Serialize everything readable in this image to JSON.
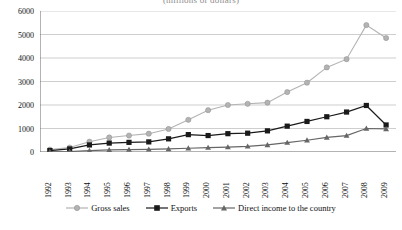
{
  "chart_data": {
    "type": "line",
    "title": "(millions of dollars)",
    "xlabel": "",
    "ylabel": "",
    "ylim": [
      0,
      6000
    ],
    "ytick_step": 1000,
    "yticks": [
      "0",
      "1000",
      "2000",
      "3000",
      "4000",
      "5000",
      "6000"
    ],
    "grid": true,
    "legend_position": "bottom",
    "categories": [
      "1992",
      "1993",
      "1994",
      "1995",
      "1996",
      "1997",
      "1998",
      "1999",
      "2000",
      "2001",
      "2002",
      "2003",
      "2004",
      "2005",
      "2006",
      "2007",
      "2008",
      "2009"
    ],
    "series": [
      {
        "name": "Gross sales",
        "color": "#b3b3b3",
        "marker": "circle",
        "values": [
          100,
          190,
          440,
          620,
          700,
          780,
          980,
          1370,
          1780,
          2000,
          2050,
          2100,
          2550,
          2950,
          3600,
          3950,
          5400,
          4850
        ]
      },
      {
        "name": "Exports",
        "color": "#1a1a1a",
        "marker": "square",
        "values": [
          60,
          130,
          300,
          380,
          410,
          430,
          560,
          740,
          700,
          780,
          800,
          900,
          1100,
          1300,
          1500,
          1700,
          1980,
          1150
        ]
      },
      {
        "name": "Direct income to the country",
        "color": "#666666",
        "marker": "triangle",
        "values": [
          10,
          20,
          60,
          90,
          100,
          110,
          130,
          160,
          190,
          210,
          240,
          300,
          400,
          500,
          620,
          700,
          1000,
          980
        ]
      }
    ]
  },
  "legend": {
    "items": [
      {
        "label": "Gross sales"
      },
      {
        "label": "Exports"
      },
      {
        "label": "Direct income to the country"
      }
    ]
  }
}
